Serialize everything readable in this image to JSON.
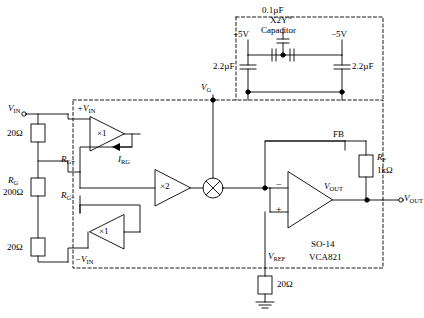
{
  "labels": {
    "vin_left": "V",
    "vin_left_sub": "IN",
    "r20_top": "20Ω",
    "r20_bottom": "20Ω",
    "rg": "R",
    "rg_sub": "G",
    "rg_value": "200Ω",
    "rg_plus": "R",
    "rg_plus_sub": "G+",
    "rg_minus": "R",
    "rg_minus_sub": "G−",
    "irg": "I",
    "irg_sub": "RG",
    "plus_vin": "+V",
    "plus_vin_sub": "IN",
    "minus_vin": "−V",
    "minus_vin_sub": "IN",
    "buf_gain_top": "×1",
    "buf_gain_bottom": "×1",
    "gain_block": "×2",
    "vg": "V",
    "vg_sub": "G",
    "cap_01uf": "0.1µF",
    "cap_x2y": "X2Y",
    "cap_x2y_sup": "®",
    "cap_word": "Capacitor",
    "supply_pos": "+5V",
    "supply_neg": "−5V",
    "cap_22_left": "2.2µF",
    "cap_22_right": "2.2µF",
    "fb": "FB",
    "rf": "R",
    "rf_sub": "F",
    "rf_value": "1kΩ",
    "vout_inner": "V",
    "vout_inner_sub": "OUT",
    "vout_node": "V",
    "vout_node_sub": "OUT",
    "vref": "V",
    "vref_sub": "REF",
    "r20_vref": "20Ω",
    "package": "SO-14",
    "part": "VCA821",
    "opamp_minus": "−",
    "opamp_plus": "+"
  },
  "colors": {
    "line": "#000000",
    "background": "#ffffff"
  }
}
